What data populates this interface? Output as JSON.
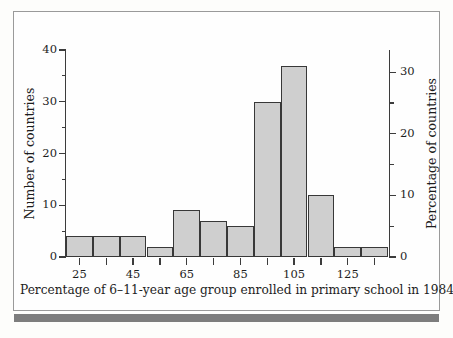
{
  "figure": {
    "background_color": "#fefefe",
    "frame_color": "#9a9a9a",
    "bottom_rule_color": "#7d7d7d",
    "bar_fill_color": "#cfcfcf",
    "bar_edge_color": "#383838",
    "axis_color": "#3c3c3c",
    "text_color": "#1d1d1d"
  },
  "chart_data": {
    "type": "bar",
    "title": "",
    "subtitle": "",
    "xlabel": "Percentage of 6–11-year age group enrolled in primary school in 1984",
    "ylabel": "Number of countries",
    "ylabel_secondary": "Percentage of countries",
    "grid": false,
    "legend": false,
    "legend_position": "none",
    "bin_width": 10,
    "bin_starts": [
      20,
      30,
      40,
      50,
      60,
      70,
      80,
      90,
      100,
      110,
      120,
      130
    ],
    "bin_centers": [
      25,
      35,
      45,
      55,
      65,
      75,
      85,
      95,
      105,
      115,
      125,
      135
    ],
    "categories": [
      "20–30",
      "30–40",
      "40–50",
      "50–60",
      "60–70",
      "70–80",
      "80–90",
      "90–100",
      "100–110",
      "110–120",
      "120–130",
      "130–140"
    ],
    "values": [
      4,
      4,
      4,
      2,
      9,
      7,
      6,
      30,
      37,
      12,
      2,
      2
    ],
    "values_percent": [
      3.4,
      3.4,
      3.4,
      1.7,
      7.6,
      5.9,
      5.0,
      25.2,
      31.1,
      10.1,
      1.7,
      1.7
    ],
    "total_countries": 119,
    "xlim": [
      20,
      140
    ],
    "ylim": [
      0,
      40
    ],
    "ylim_secondary": [
      0,
      33.6
    ],
    "xticks_major": [
      25,
      45,
      65,
      85,
      105,
      125
    ],
    "xticks_minor": [
      35,
      55,
      75,
      95,
      115,
      135
    ],
    "xticklabels": [
      "25",
      "45",
      "65",
      "85",
      "105",
      "125"
    ],
    "yticks_major": [
      0,
      10,
      20,
      30,
      40
    ],
    "yticks_minor": [
      5,
      15,
      25,
      35
    ],
    "yticklabels": [
      "0",
      "10",
      "20",
      "30",
      "40"
    ],
    "yticks_major_secondary": [
      0,
      10,
      20,
      30
    ],
    "yticks_minor_secondary": [
      5,
      15,
      25
    ],
    "yticklabels_secondary": [
      "0",
      "10",
      "20",
      "30"
    ]
  }
}
